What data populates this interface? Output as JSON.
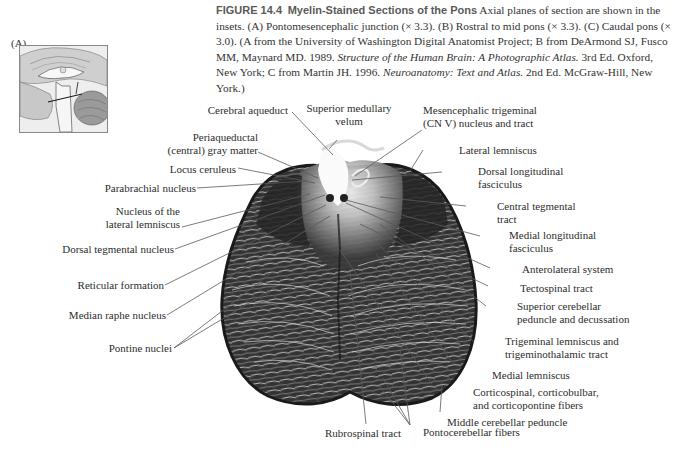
{
  "figure": {
    "number_label": "FIGURE 14.4",
    "title": "Myelin-Stained Sections of the Pons",
    "caption_part1": " Axial planes of section are shown in the insets. (A) Pontomesencephalic junction (× 3.3). (B) Rostral to mid pons (× 3.3). (C) Caudal pons (× 3.0). (A from the University of Washington Digital Anatomist Project; B from DeArmond SJ, Fusco MM, Maynard MD. 1989. ",
    "caption_italic1": "Structure of the Human Brain: A Photographic Atlas.",
    "caption_part2": " 3rd Ed. Oxford, New York; C from Martin JH. 1996. ",
    "caption_italic2": "Neuroanatomy: Text and Atlas.",
    "caption_part3": " 2nd Ed. McGraw-Hill, New York.)",
    "panel_letter": "(A)",
    "inset_description": "Mid-sagittal brain inset with plane-of-section line through pontomesencephalic junction"
  },
  "labels": {
    "left": [
      {
        "id": "cerebral-aqueduct",
        "text": "Cerebral aqueduct"
      },
      {
        "id": "periaqueductal",
        "text": "Periaqueductal\n(central) gray matter"
      },
      {
        "id": "locus-ceruleus",
        "text": "Locus ceruleus"
      },
      {
        "id": "parabrachial-nucleus",
        "text": "Parabrachial nucleus"
      },
      {
        "id": "nucleus-lateral-lemniscus",
        "text": "Nucleus of the\nlateral lemniscus"
      },
      {
        "id": "dorsal-tegmental-nucleus",
        "text": "Dorsal tegmental nucleus"
      },
      {
        "id": "reticular-formation",
        "text": "Reticular formation"
      },
      {
        "id": "median-raphe-nucleus",
        "text": "Median raphe nucleus"
      },
      {
        "id": "pontine-nuclei",
        "text": "Pontine nuclei"
      }
    ],
    "top": [
      {
        "id": "superior-medullary-velum",
        "text": "Superior medullary\nvelum"
      }
    ],
    "right": [
      {
        "id": "mesencephalic-trigeminal",
        "text": "Mesencephalic trigeminal\n(CN V) nucleus and tract"
      },
      {
        "id": "lateral-lemniscus",
        "text": "Lateral lemniscus"
      },
      {
        "id": "dorsal-longitudinal-fasciculus",
        "text": "Dorsal longitudinal\nfasciculus"
      },
      {
        "id": "central-tegmental-tract",
        "text": "Central tegmental\ntract"
      },
      {
        "id": "medial-longitudinal-fasciculus",
        "text": "Medial longitudinal\nfasciculus"
      },
      {
        "id": "anterolateral-system",
        "text": "Anterolateral system"
      },
      {
        "id": "tectospinal-tract",
        "text": "Tectospinal tract"
      },
      {
        "id": "superior-cerebellar-peduncle",
        "text": "Superior cerebellar\npeduncle and decussation"
      },
      {
        "id": "trigeminal-lemniscus",
        "text": "Trigeminal lemniscus and\ntrigeminothalamic tract"
      },
      {
        "id": "medial-lemniscus",
        "text": "Medial lemniscus"
      },
      {
        "id": "corticospinal-fibers",
        "text": "Corticospinal, corticobulbar,\nand corticopontine fibers"
      },
      {
        "id": "middle-cerebellar-peduncle",
        "text": "Middle cerebellar peduncle"
      }
    ],
    "bottom": [
      {
        "id": "rubrospinal-tract",
        "text": "Rubrospinal tract"
      },
      {
        "id": "pontocerebellar-fibers",
        "text": "Pontocerebellar fibers"
      }
    ]
  },
  "colors": {
    "background": "#ffffff",
    "text": "#2d2d2d",
    "heading": "#5a5a5a",
    "specimen_dark": "#2b2b2b",
    "specimen_light": "#e8e8e8",
    "leader_line": "#555555"
  }
}
